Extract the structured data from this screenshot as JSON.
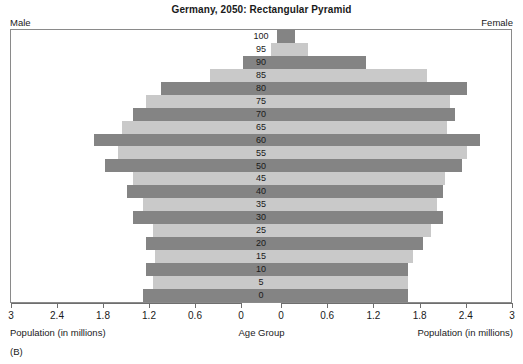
{
  "header": {
    "title": "Germany, 2050: Rectangular Pyramid",
    "left_label": "Male",
    "right_label": "Female"
  },
  "footer": {
    "left_axis_label": "Population (in millions)",
    "center_axis_label": "Age Group",
    "right_axis_label": "Population (in millions)",
    "panel_id": "(B)"
  },
  "colors": {
    "bar_dark": "#848484",
    "bar_light": "#c9c9c9",
    "frame": "#8a8a8a",
    "text": "#1a1a1a",
    "background": "#ffffff"
  },
  "chart_data": {
    "type": "bar",
    "subtype": "population-pyramid",
    "title": "Germany, 2050: Rectangular Pyramid",
    "xlabel": "Population (in millions)",
    "ylabel": "Age Group",
    "xlim": [
      0,
      3
    ],
    "xticks": [
      3,
      2.4,
      1.8,
      1.2,
      0.6,
      0
    ],
    "xticklabels_left": [
      "3",
      "2.4",
      "1.8",
      "1.2",
      "0.6",
      "0"
    ],
    "xticklabels_right": [
      "0",
      "0.6",
      "1.2",
      "1.8",
      "2.4",
      "3"
    ],
    "grid": false,
    "legend": false,
    "orientation": "horizontal-mirrored",
    "categories": [
      "100",
      "95",
      "90",
      "85",
      "80",
      "75",
      "70",
      "65",
      "60",
      "55",
      "50",
      "45",
      "40",
      "35",
      "30",
      "25",
      "20",
      "15",
      "10",
      "5",
      "0"
    ],
    "series": [
      {
        "name": "Male",
        "side": "left",
        "values": [
          0.05,
          0.13,
          0.5,
          0.93,
          1.57,
          1.76,
          1.93,
          2.08,
          2.44,
          2.13,
          2.29,
          1.93,
          2.01,
          1.8,
          1.93,
          1.67,
          1.76,
          1.65,
          1.76,
          1.67,
          1.8
        ]
      },
      {
        "name": "Female",
        "side": "right",
        "values": [
          0.18,
          0.35,
          1.1,
          1.9,
          2.41,
          2.19,
          2.26,
          2.15,
          2.59,
          2.41,
          2.35,
          2.13,
          2.1,
          2.02,
          2.1,
          1.95,
          1.84,
          1.72,
          1.65,
          1.65,
          1.65
        ]
      }
    ]
  }
}
